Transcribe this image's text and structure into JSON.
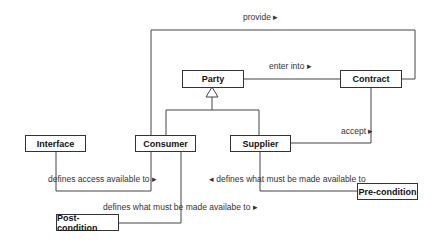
{
  "diagram": {
    "type": "UML class diagram",
    "classes": {
      "party": "Party",
      "contract": "Contract",
      "consumer": "Consumer",
      "supplier": "Supplier",
      "interface": "Interface",
      "precondition": "Pre-condition",
      "postcondition": "Post-condition"
    },
    "associations": {
      "provide": "provide ▸",
      "enter_into": "enter into ▸",
      "accept": "accept ▸",
      "defines_access": "defines access available to ▸",
      "defines_pre": "◂  defines what must be made available to",
      "defines_post": "defines what must be made availabe to ▸"
    },
    "relationships": [
      {
        "from": "Consumer",
        "to": "Contract",
        "label": "provide",
        "type": "association"
      },
      {
        "from": "Party",
        "to": "Contract",
        "label": "enter into",
        "type": "association"
      },
      {
        "from": "Supplier",
        "to": "Contract",
        "label": "accept",
        "type": "association"
      },
      {
        "from": "Consumer",
        "to": "Party",
        "type": "generalization"
      },
      {
        "from": "Supplier",
        "to": "Party",
        "type": "generalization"
      },
      {
        "from": "Interface",
        "to": "Consumer",
        "label": "defines access available to",
        "type": "association"
      },
      {
        "from": "Pre-condition",
        "to": "Supplier",
        "label": "defines what must be made available to",
        "type": "association"
      },
      {
        "from": "Post-condition",
        "to": "Consumer",
        "label": "defines what must be made availabe to",
        "type": "association"
      }
    ]
  }
}
